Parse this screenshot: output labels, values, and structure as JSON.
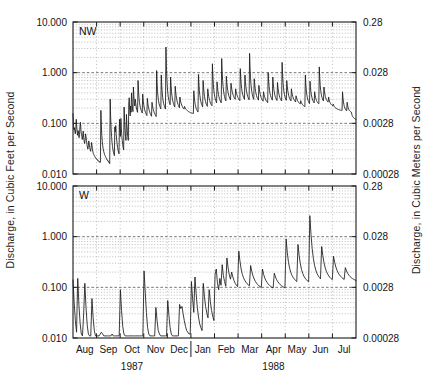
{
  "figure": {
    "left_axis_title": "Discharge, in Cubic Feet per Second",
    "right_axis_title": "Discharge, in Cubic Meters per Second",
    "panels": [
      {
        "label": "NW"
      },
      {
        "label": "W"
      }
    ]
  },
  "chart_data": {
    "type": "line",
    "title": "",
    "subtitle": "",
    "xlabel": "",
    "ylabel": "Discharge, in Cubic Feet per Second",
    "ylabel_right": "Discharge, in Cubic Meters per Second",
    "grid": true,
    "legend_position": "none",
    "yscale": "log",
    "ylim": [
      0.01,
      10.0
    ],
    "ylim_right": [
      0.00028,
      0.28
    ],
    "ytick_labels": [
      "10.000",
      "1.000",
      "0.100",
      "0.010"
    ],
    "ytick_values": [
      10.0,
      1.0,
      0.1,
      0.01
    ],
    "ytick_labels_right": [
      "0.28",
      "0.028",
      "0.0028",
      "0.00028"
    ],
    "ytick_values_right": [
      0.28,
      0.028,
      0.0028,
      0.00028
    ],
    "unit_conversion_note": "1 cubic foot per second = 0.028 cubic meters per second",
    "xtick_labels": [
      "Aug",
      "Sep",
      "Oct",
      "Nov",
      "Dec",
      "Jan",
      "Feb",
      "Mar",
      "Apr",
      "May",
      "Jun",
      "Jul"
    ],
    "x_group_labels": [
      "1987",
      "1988"
    ],
    "x_group_spans": [
      [
        0,
        5
      ],
      [
        5,
        12
      ]
    ],
    "x_year_divider_after": "Dec",
    "series": [
      {
        "name": "NW",
        "panel": 0,
        "color": "#1a1a1a",
        "values": [
          0.155,
          0.092,
          0.075,
          0.082,
          0.07,
          0.062,
          0.077,
          0.12,
          0.088,
          0.068,
          0.058,
          0.072,
          0.063,
          0.052,
          0.06,
          0.085,
          0.105,
          0.074,
          0.061,
          0.055,
          0.048,
          0.058,
          0.07,
          0.052,
          0.044,
          0.04,
          0.047,
          0.062,
          0.054,
          0.046,
          0.038,
          0.034,
          0.031,
          0.036,
          0.045,
          0.039,
          0.033,
          0.03,
          0.028,
          0.033,
          0.042,
          0.036,
          0.03,
          0.027,
          0.025,
          0.024,
          0.023,
          0.022,
          0.021,
          0.021,
          0.02,
          0.02,
          0.019,
          0.019,
          0.018,
          0.018,
          0.018,
          0.017,
          0.017,
          0.017,
          0.18,
          0.092,
          0.058,
          0.044,
          0.036,
          0.031,
          0.028,
          0.026,
          0.024,
          0.023,
          0.022,
          0.021,
          0.02,
          0.019,
          0.019,
          0.018,
          0.018,
          0.017,
          0.017,
          0.016,
          0.3,
          0.135,
          0.078,
          0.055,
          0.042,
          0.035,
          0.03,
          0.027,
          0.025,
          0.023,
          0.085,
          0.068,
          0.09,
          0.06,
          0.047,
          0.039,
          0.033,
          0.029,
          0.027,
          0.025,
          0.12,
          0.075,
          0.055,
          0.125,
          0.08,
          0.058,
          0.046,
          0.038,
          0.033,
          0.03,
          0.21,
          0.11,
          0.072,
          0.055,
          0.046,
          0.15,
          0.095,
          0.068,
          0.054,
          0.046,
          0.24,
          0.32,
          0.18,
          0.14,
          0.22,
          0.165,
          0.4,
          0.26,
          0.2,
          0.17,
          0.52,
          0.34,
          0.26,
          0.22,
          0.3,
          0.25,
          0.21,
          0.19,
          0.175,
          0.165,
          0.7,
          0.45,
          0.32,
          0.26,
          0.23,
          0.205,
          0.19,
          0.178,
          0.168,
          0.16,
          0.38,
          0.29,
          0.24,
          0.21,
          0.19,
          0.175,
          0.165,
          0.155,
          0.148,
          0.142,
          0.31,
          0.25,
          0.215,
          0.195,
          0.18,
          0.168,
          0.158,
          0.15,
          0.143,
          0.138,
          0.26,
          0.225,
          0.2,
          0.185,
          0.172,
          0.162,
          0.154,
          0.147,
          0.141,
          0.136,
          1.1,
          0.62,
          0.42,
          0.33,
          0.28,
          0.25,
          0.23,
          0.215,
          0.203,
          0.193,
          0.9,
          0.55,
          0.4,
          0.32,
          0.275,
          0.248,
          0.228,
          0.213,
          0.201,
          0.191,
          3.2,
          1.4,
          0.78,
          0.52,
          0.4,
          0.335,
          0.295,
          0.268,
          0.248,
          0.233,
          0.82,
          0.56,
          0.42,
          0.345,
          0.3,
          0.27,
          0.249,
          0.233,
          0.22,
          0.21,
          0.54,
          0.42,
          0.35,
          0.305,
          0.275,
          0.253,
          0.236,
          0.223,
          0.212,
          0.203,
          0.33,
          0.29,
          0.262,
          0.243,
          0.229,
          0.218,
          0.209,
          0.202,
          0.196,
          0.191,
          0.215,
          0.205,
          0.197,
          0.191,
          0.186,
          0.182,
          0.178,
          0.175,
          0.172,
          0.17,
          0.168,
          0.166,
          0.164,
          0.163,
          0.161,
          0.16,
          0.159,
          0.158,
          0.157,
          0.156,
          0.44,
          0.33,
          0.27,
          0.235,
          0.213,
          0.198,
          0.187,
          0.179,
          0.172,
          0.167,
          0.92,
          0.6,
          0.44,
          0.355,
          0.305,
          0.272,
          0.25,
          0.234,
          0.222,
          0.212,
          0.7,
          0.5,
          0.4,
          0.34,
          0.3,
          0.272,
          0.252,
          0.237,
          0.225,
          0.216,
          0.48,
          0.395,
          0.342,
          0.307,
          0.282,
          0.264,
          0.25,
          0.239,
          0.23,
          0.223,
          1.5,
          0.85,
          0.59,
          0.46,
          0.385,
          0.338,
          0.306,
          0.283,
          0.266,
          0.253,
          0.66,
          0.51,
          0.425,
          0.372,
          0.336,
          0.31,
          0.291,
          0.276,
          0.264,
          0.255,
          1.9,
          1.05,
          0.7,
          0.53,
          0.435,
          0.378,
          0.34,
          0.313,
          0.293,
          0.278,
          0.85,
          0.64,
          0.52,
          0.445,
          0.395,
          0.36,
          0.335,
          0.316,
          0.301,
          0.289,
          0.62,
          0.52,
          0.455,
          0.41,
          0.378,
          0.354,
          0.335,
          0.32,
          0.308,
          0.298,
          0.48,
          0.425,
          0.387,
          0.359,
          0.338,
          0.321,
          0.308,
          0.297,
          0.288,
          0.28,
          1.2,
          0.78,
          0.59,
          0.485,
          0.42,
          0.378,
          0.348,
          0.326,
          0.309,
          0.296,
          0.9,
          0.66,
          0.53,
          0.452,
          0.4,
          0.364,
          0.338,
          0.318,
          0.303,
          0.291,
          2.4,
          1.25,
          0.8,
          0.59,
          0.475,
          0.408,
          0.364,
          0.334,
          0.312,
          0.296,
          0.76,
          0.59,
          0.49,
          0.425,
          0.382,
          0.351,
          0.328,
          0.311,
          0.298,
          0.287,
          0.56,
          0.47,
          0.412,
          0.372,
          0.343,
          0.321,
          0.305,
          0.292,
          0.282,
          0.273,
          0.42,
          0.375,
          0.343,
          0.32,
          0.302,
          0.288,
          0.277,
          0.268,
          0.261,
          0.255,
          1.0,
          0.68,
          0.53,
          0.445,
          0.392,
          0.356,
          0.331,
          0.312,
          0.298,
          0.287,
          0.82,
          0.6,
          0.485,
          0.417,
          0.373,
          0.343,
          0.321,
          0.305,
          0.292,
          0.282,
          0.64,
          0.51,
          0.432,
          0.383,
          0.35,
          0.326,
          0.308,
          0.295,
          0.284,
          0.276,
          1.6,
          0.92,
          0.64,
          0.5,
          0.42,
          0.37,
          0.337,
          0.314,
          0.297,
          0.284,
          0.7,
          0.545,
          0.455,
          0.398,
          0.36,
          0.333,
          0.313,
          0.298,
          0.286,
          0.277,
          0.48,
          0.41,
          0.366,
          0.336,
          0.315,
          0.299,
          0.287,
          0.278,
          0.27,
          0.264,
          0.35,
          0.32,
          0.299,
          0.284,
          0.272,
          0.263,
          0.256,
          0.25,
          0.245,
          0.241,
          0.28,
          0.262,
          0.25,
          0.241,
          0.234,
          0.228,
          0.223,
          0.219,
          0.216,
          0.213,
          0.9,
          0.6,
          0.455,
          0.378,
          0.332,
          0.302,
          0.281,
          0.266,
          0.254,
          0.245,
          0.68,
          0.51,
          0.42,
          0.365,
          0.329,
          0.304,
          0.286,
          0.272,
          0.262,
          0.253,
          0.42,
          0.36,
          0.323,
          0.299,
          0.282,
          0.27,
          0.26,
          0.253,
          0.247,
          0.242,
          1.3,
          0.78,
          0.56,
          0.45,
          0.388,
          0.348,
          0.321,
          0.302,
          0.287,
          0.276,
          0.52,
          0.43,
          0.375,
          0.34,
          0.316,
          0.299,
          0.286,
          0.276,
          0.268,
          0.262,
          0.33,
          0.296,
          0.274,
          0.259,
          0.248,
          0.24,
          0.234,
          0.229,
          0.225,
          0.222,
          0.24,
          0.226,
          0.217,
          0.21,
          0.205,
          0.201,
          0.198,
          0.195,
          0.193,
          0.191,
          0.189,
          0.187,
          0.186,
          0.185,
          0.184,
          0.183,
          0.182,
          0.181,
          0.18,
          0.18,
          0.42,
          0.32,
          0.266,
          0.234,
          0.214,
          0.201,
          0.192,
          0.185,
          0.18,
          0.176,
          0.26,
          0.224,
          0.204,
          0.192,
          0.184,
          0.178,
          0.174,
          0.171,
          0.168,
          0.166,
          0.15,
          0.142,
          0.136,
          0.132,
          0.129,
          0.126,
          0.124,
          0.122,
          0.121,
          0.12
        ]
      },
      {
        "name": "W",
        "panel": 1,
        "color": "#1a1a1a",
        "values": [
          0.14,
          0.05,
          0.022,
          0.013,
          0.15,
          0.045,
          0.02,
          0.012,
          0.011,
          0.03,
          0.12,
          0.04,
          0.018,
          0.012,
          0.011,
          0.011,
          0.06,
          0.025,
          0.014,
          0.011,
          0.011,
          0.011,
          0.011,
          0.012,
          0.013,
          0.012,
          0.011,
          0.011,
          0.011,
          0.011,
          0.011,
          0.011,
          0.011,
          0.012,
          0.011,
          0.011,
          0.011,
          0.011,
          0.011,
          0.011,
          0.09,
          0.035,
          0.017,
          0.012,
          0.011,
          0.011,
          0.011,
          0.011,
          0.011,
          0.011,
          0.011,
          0.011,
          0.011,
          0.011,
          0.011,
          0.011,
          0.011,
          0.011,
          0.011,
          0.011,
          0.21,
          0.08,
          0.032,
          0.016,
          0.012,
          0.011,
          0.011,
          0.011,
          0.011,
          0.011,
          0.04,
          0.022,
          0.014,
          0.012,
          0.011,
          0.011,
          0.011,
          0.011,
          0.011,
          0.011,
          0.055,
          0.028,
          0.016,
          0.012,
          0.011,
          0.011,
          0.011,
          0.011,
          0.011,
          0.011,
          0.046,
          0.038,
          0.042,
          0.03,
          0.022,
          0.017,
          0.014,
          0.013,
          0.012,
          0.012,
          0.13,
          0.06,
          0.032,
          0.16,
          0.075,
          0.04,
          0.026,
          0.019,
          0.016,
          0.014,
          0.12,
          0.065,
          0.042,
          0.031,
          0.025,
          0.09,
          0.052,
          0.035,
          0.027,
          0.022,
          0.18,
          0.23,
          0.12,
          0.09,
          0.15,
          0.11,
          0.28,
          0.17,
          0.13,
          0.105,
          0.38,
          0.24,
          0.175,
          0.145,
          0.2,
          0.16,
          0.135,
          0.12,
          0.11,
          0.103,
          0.52,
          0.33,
          0.23,
          0.18,
          0.155,
          0.138,
          0.127,
          0.118,
          0.112,
          0.107,
          0.27,
          0.205,
          0.168,
          0.146,
          0.131,
          0.121,
          0.113,
          0.107,
          0.103,
          0.099,
          0.23,
          0.18,
          0.152,
          0.135,
          0.124,
          0.115,
          0.109,
          0.104,
          0.1,
          0.097,
          0.19,
          0.16,
          0.141,
          0.129,
          0.12,
          0.113,
          0.108,
          0.104,
          0.1,
          0.098,
          0.9,
          0.48,
          0.31,
          0.235,
          0.195,
          0.171,
          0.156,
          0.145,
          0.136,
          0.13,
          0.7,
          0.42,
          0.29,
          0.225,
          0.188,
          0.166,
          0.152,
          0.142,
          0.134,
          0.128,
          2.6,
          1.1,
          0.58,
          0.37,
          0.272,
          0.22,
          0.19,
          0.17,
          0.157,
          0.147,
          0.64,
          0.42,
          0.305,
          0.243,
          0.207,
          0.184,
          0.168,
          0.157,
          0.148,
          0.142,
          0.41,
          0.31,
          0.252,
          0.216,
          0.193,
          0.177,
          0.165,
          0.156,
          0.149,
          0.143,
          0.245,
          0.21,
          0.188,
          0.174,
          0.163,
          0.155,
          0.149,
          0.144,
          0.14,
          0.136
        ]
      }
    ]
  }
}
